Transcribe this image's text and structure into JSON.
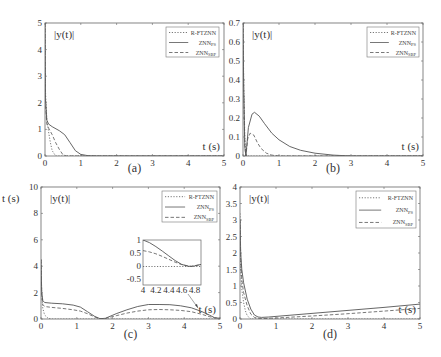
{
  "chart_data": [
    {
      "panel": "a",
      "type": "line",
      "caption": "(a)",
      "ylabel_inset": "|y(t)|",
      "xlabel_inset": "t (s)",
      "xlim": [
        0,
        5
      ],
      "ylim": [
        0,
        5
      ],
      "xticks": [
        0,
        1,
        2,
        3,
        4,
        5
      ],
      "yticks": [
        0,
        1,
        2,
        3,
        4,
        5
      ],
      "legend": [
        "R-FTZNN",
        "ZNN_PS",
        "ZNN_SBP"
      ],
      "legend_position": "upper right",
      "series": [
        {
          "name": "R-FTZNN",
          "style": "dotted",
          "x": [
            0,
            0.01,
            0.05,
            0.1,
            0.15,
            0.2,
            0.3,
            5
          ],
          "y": [
            5,
            2.5,
            1.4,
            0.9,
            0.5,
            0.2,
            0,
            0
          ]
        },
        {
          "name": "ZNN_PS",
          "style": "solid",
          "x": [
            0,
            0.01,
            0.05,
            0.1,
            0.2,
            0.4,
            0.55,
            0.7,
            0.85,
            1.0,
            1.2,
            1.5,
            5
          ],
          "y": [
            5,
            2.2,
            1.35,
            1.2,
            1.1,
            0.95,
            0.8,
            0.5,
            0.2,
            0.06,
            0.01,
            0,
            0
          ]
        },
        {
          "name": "ZNN_SBP",
          "style": "dashed",
          "x": [
            0,
            0.01,
            0.05,
            0.1,
            0.2,
            0.3,
            0.4,
            0.5,
            0.6,
            5
          ],
          "y": [
            5,
            2.0,
            1.2,
            1.05,
            0.8,
            0.5,
            0.25,
            0.05,
            0,
            0
          ]
        }
      ]
    },
    {
      "panel": "b",
      "type": "line",
      "caption": "(b)",
      "ylabel_inset": "|y(t)|",
      "xlabel_inset": "t (s)",
      "xlim": [
        0,
        5
      ],
      "ylim": [
        0,
        0.7
      ],
      "xticks": [
        0,
        1,
        2,
        3,
        4,
        5
      ],
      "yticks": [
        0,
        0.1,
        0.2,
        0.3,
        0.4,
        0.5,
        0.6,
        0.7
      ],
      "legend": [
        "R-FTZNN",
        "ZNN_PS",
        "ZNN_SBP"
      ],
      "legend_position": "upper right",
      "series": [
        {
          "name": "R-FTZNN",
          "style": "dotted",
          "x": [
            0,
            0.02,
            0.05,
            0.08,
            0.1,
            5
          ],
          "y": [
            0.7,
            0.4,
            0.1,
            0.01,
            0,
            0
          ]
        },
        {
          "name": "ZNN_PS",
          "style": "solid",
          "x": [
            0,
            0.02,
            0.05,
            0.08,
            0.15,
            0.25,
            0.32,
            0.45,
            0.6,
            0.8,
            1.0,
            1.3,
            1.6,
            2.0,
            2.5,
            3,
            5
          ],
          "y": [
            0.7,
            0.35,
            0.05,
            0.0,
            0.15,
            0.22,
            0.23,
            0.21,
            0.17,
            0.12,
            0.085,
            0.05,
            0.03,
            0.015,
            0.005,
            0,
            0
          ]
        },
        {
          "name": "ZNN_SBP",
          "style": "dashed",
          "x": [
            0,
            0.02,
            0.05,
            0.08,
            0.13,
            0.2,
            0.3,
            0.4,
            0.5,
            0.65,
            0.8,
            1.0,
            5
          ],
          "y": [
            0.7,
            0.35,
            0.05,
            0.0,
            0.09,
            0.12,
            0.11,
            0.07,
            0.04,
            0.015,
            0.005,
            0,
            0
          ]
        }
      ]
    },
    {
      "panel": "c",
      "type": "line",
      "caption": "(c)",
      "ylabel_outer": "t (s)",
      "ylabel_inset": "|y(t)|",
      "xlabel_inset": "t (s)",
      "xlim": [
        0,
        5
      ],
      "ylim": [
        0,
        10
      ],
      "xticks": [
        0,
        1,
        2,
        3,
        4,
        5
      ],
      "yticks": [
        0,
        2,
        4,
        6,
        8,
        10
      ],
      "legend": [
        "R-FTZNN",
        "ZNN_PS",
        "ZNN_SBP"
      ],
      "legend_position": "upper right",
      "series": [
        {
          "name": "R-FTZNN",
          "style": "dotted",
          "x": [
            0,
            0.02,
            0.05,
            0.1,
            0.2,
            0.3,
            5
          ],
          "y": [
            4.5,
            2.0,
            0.8,
            0.3,
            0.05,
            0,
            0
          ]
        },
        {
          "name": "ZNN_PS",
          "style": "solid",
          "x": [
            0,
            0.02,
            0.05,
            0.1,
            0.3,
            0.6,
            0.9,
            1.1,
            1.3,
            1.5,
            1.65,
            1.8,
            2.1,
            2.4,
            2.7,
            3.0,
            3.3,
            3.6,
            3.9,
            4.2,
            4.5,
            4.7,
            4.85,
            5.0
          ],
          "y": [
            4.5,
            2.0,
            1.4,
            1.25,
            1.2,
            1.15,
            1.05,
            0.9,
            0.55,
            0.2,
            0.02,
            0.05,
            0.4,
            0.7,
            0.95,
            1.1,
            1.1,
            1.08,
            1.0,
            0.85,
            0.55,
            0.3,
            0.1,
            0.05
          ]
        },
        {
          "name": "ZNN_SBP",
          "style": "dashed",
          "x": [
            0,
            0.02,
            0.05,
            0.1,
            0.3,
            0.6,
            0.9,
            1.1,
            1.3,
            1.5,
            1.65,
            1.8,
            2.1,
            2.4,
            2.7,
            3.0,
            3.3,
            3.6,
            3.9,
            4.2,
            4.5,
            4.7,
            4.85,
            5.0
          ],
          "y": [
            4.5,
            1.8,
            1.1,
            0.95,
            0.88,
            0.8,
            0.7,
            0.6,
            0.4,
            0.15,
            0.02,
            0.04,
            0.25,
            0.45,
            0.6,
            0.7,
            0.72,
            0.7,
            0.65,
            0.55,
            0.35,
            0.18,
            0.08,
            0.05
          ]
        }
      ],
      "inset": {
        "xlim": [
          4,
          4.9
        ],
        "ylim": [
          -0.7,
          1
        ],
        "xticks": [
          4,
          4.2,
          4.4,
          4.6,
          4.8
        ],
        "xtick_labels": [
          "4",
          "4.2",
          "4.4",
          "4.6",
          "4.8"
        ],
        "yticks": [
          -0.5,
          0,
          0.5,
          1
        ],
        "ytick_labels": [
          "-0.5",
          "0",
          "0.5",
          "1"
        ],
        "series": [
          {
            "name": "R-FTZNN",
            "style": "dotted",
            "x": [
              4,
              4.9
            ],
            "y": [
              0,
              0
            ]
          },
          {
            "name": "ZNN_PS",
            "style": "solid",
            "x": [
              4,
              4.1,
              4.2,
              4.3,
              4.4,
              4.5,
              4.6,
              4.7,
              4.75,
              4.8,
              4.9
            ],
            "y": [
              1.0,
              0.9,
              0.75,
              0.58,
              0.4,
              0.22,
              0.08,
              0.01,
              0.0,
              0.02,
              0.08
            ]
          },
          {
            "name": "ZNN_SBP",
            "style": "dashed",
            "x": [
              4,
              4.1,
              4.2,
              4.3,
              4.4,
              4.5,
              4.6,
              4.7,
              4.75,
              4.8,
              4.9
            ],
            "y": [
              0.6,
              0.55,
              0.48,
              0.38,
              0.27,
              0.16,
              0.07,
              0.02,
              0.01,
              0.03,
              0.07
            ]
          }
        ]
      }
    },
    {
      "panel": "d",
      "type": "line",
      "caption": "(d)",
      "ylabel_inset": "|y(t)|",
      "xlabel_inset": "t (s)",
      "xlim": [
        0,
        5
      ],
      "ylim": [
        0,
        4
      ],
      "xticks": [
        0,
        1,
        2,
        3,
        4,
        5
      ],
      "yticks": [
        0,
        0.5,
        1,
        1.5,
        2,
        2.5,
        3,
        3.5,
        4
      ],
      "legend": [
        "R-FTZNN",
        "ZNN_PS",
        "ZNN_SBP"
      ],
      "legend_position": "upper right",
      "series": [
        {
          "name": "R-FTZNN",
          "style": "dotted",
          "x": [
            0,
            0.02,
            0.05,
            0.1,
            0.15,
            0.2,
            0.3,
            5
          ],
          "y": [
            3.2,
            1.5,
            0.9,
            0.5,
            0.25,
            0.1,
            0,
            0
          ]
        },
        {
          "name": "ZNN_PS",
          "style": "solid",
          "x": [
            0,
            0.02,
            0.05,
            0.1,
            0.2,
            0.3,
            0.4,
            0.5,
            0.6,
            0.8,
            1.0,
            2.0,
            3.0,
            4.0,
            5.0
          ],
          "y": [
            3.0,
            2.0,
            1.5,
            1.1,
            0.6,
            0.3,
            0.12,
            0.06,
            0.05,
            0.06,
            0.08,
            0.17,
            0.26,
            0.35,
            0.45
          ]
        },
        {
          "name": "ZNN_SBP",
          "style": "dashed",
          "x": [
            0,
            0.02,
            0.05,
            0.1,
            0.2,
            0.3,
            0.4,
            0.5,
            0.6,
            0.8,
            1.0,
            2.0,
            3.0,
            4.0,
            5.0
          ],
          "y": [
            3.0,
            1.8,
            1.2,
            0.8,
            0.4,
            0.15,
            0.05,
            0.02,
            0.01,
            0.02,
            0.03,
            0.09,
            0.16,
            0.24,
            0.32
          ]
        }
      ]
    }
  ],
  "panels": {
    "a": {
      "caption": "(a)",
      "ylabel": "|y(t)|",
      "xlabel": "t (s)"
    },
    "b": {
      "caption": "(b)",
      "ylabel": "|y(t)|",
      "xlabel": "t (s)"
    },
    "c": {
      "caption": "(c)",
      "ylabel": "|y(t)|",
      "xlabel": "t (s)",
      "outer_label": "t (s)"
    },
    "d": {
      "caption": "(d)",
      "ylabel": "|y(t)|",
      "xlabel": "t (s)"
    }
  },
  "legend": {
    "items": [
      {
        "label": "R-FTZNN",
        "sub": "",
        "style": "dotted"
      },
      {
        "label": "ZNN",
        "sub": "PS",
        "style": "solid"
      },
      {
        "label": "ZNN",
        "sub": "SBP",
        "style": "dashed"
      }
    ]
  },
  "colors": {
    "line": "#555555",
    "frame": "#666666",
    "text": "#333333"
  }
}
